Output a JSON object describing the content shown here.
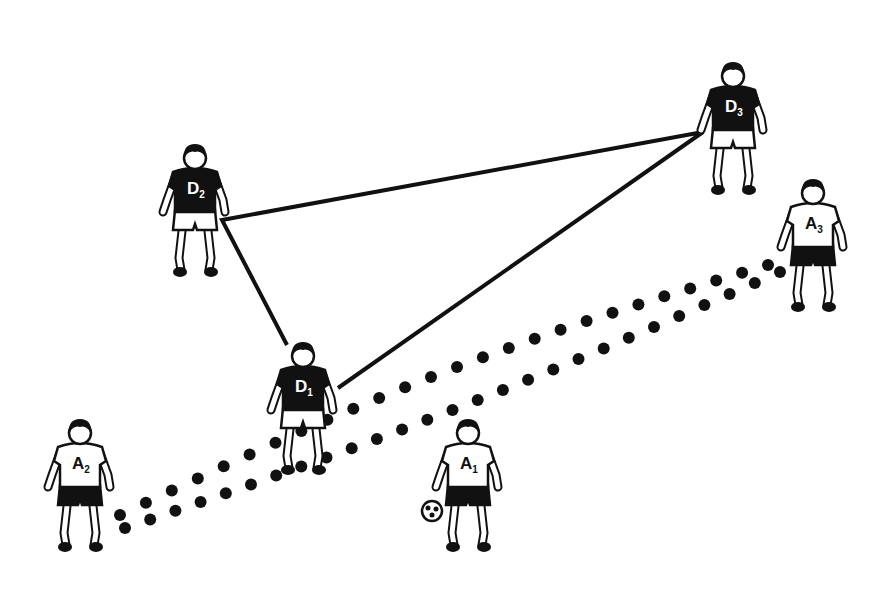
{
  "diagram": {
    "type": "soccer-tactics-illustration",
    "background": "#ffffff",
    "ink": "#111111",
    "players": [
      {
        "id": "D1",
        "letter": "D",
        "number": "1",
        "team": "defender",
        "shirt": "dark",
        "x": 303,
        "y": 398
      },
      {
        "id": "D2",
        "letter": "D",
        "number": "2",
        "team": "defender",
        "shirt": "dark",
        "x": 195,
        "y": 200
      },
      {
        "id": "D3",
        "letter": "D",
        "number": "3",
        "team": "defender",
        "shirt": "dark",
        "x": 733,
        "y": 118
      },
      {
        "id": "A1",
        "letter": "A",
        "number": "1",
        "team": "attacker",
        "shirt": "light",
        "x": 468,
        "y": 475
      },
      {
        "id": "A2",
        "letter": "A",
        "number": "2",
        "team": "attacker",
        "shirt": "light",
        "x": 80,
        "y": 475
      },
      {
        "id": "A3",
        "letter": "A",
        "number": "3",
        "team": "attacker",
        "shirt": "light",
        "x": 813,
        "y": 235
      }
    ],
    "triangle": {
      "description": "Defensive triangle linking D1, D2, D3",
      "points": [
        [
          222,
          220
        ],
        [
          703,
          132
        ],
        [
          338,
          388
        ],
        [
          287,
          345
        ]
      ]
    },
    "ball": {
      "x": 432,
      "y": 511
    },
    "dotted_paths": [
      {
        "name": "upper-pass-line",
        "from": "A2",
        "to": "A3",
        "start": [
          120,
          515
        ],
        "end": [
          768,
          265
        ],
        "dots": 26
      },
      {
        "name": "lower-pass-line",
        "from": "A2",
        "to": "A3",
        "start": [
          125,
          528
        ],
        "end": [
          780,
          272
        ],
        "dots": 27
      }
    ]
  }
}
